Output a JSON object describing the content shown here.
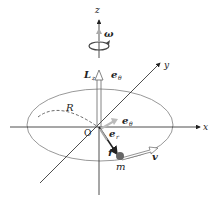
{
  "diagram": {
    "type": "rotating-mass-angular-momentum",
    "axes": {
      "x": "x",
      "y": "y",
      "z": "z"
    },
    "origin_label": "O",
    "radius_label": "R",
    "angular_velocity_label": "ω",
    "angular_momentum_label": "L",
    "angular_momentum_subscript": "z",
    "unit_vector_theta_top": "e",
    "unit_vector_theta_top_sub": "θ",
    "unit_vector_theta": "e",
    "unit_vector_theta_sub": "θ",
    "unit_vector_r": "e",
    "unit_vector_r_sub": "r",
    "position_vector_label": "r",
    "velocity_label": "v",
    "mass_label": "m",
    "colors": {
      "axes": "#222222",
      "orbit": "#999999",
      "mass": "#666666",
      "unit_vector_fill": "#bbbbbb"
    }
  }
}
